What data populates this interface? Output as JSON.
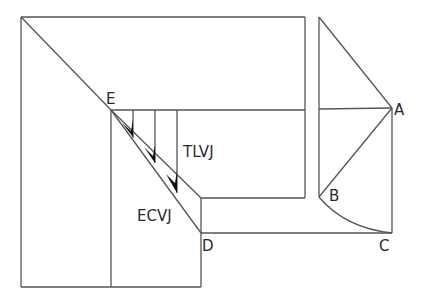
{
  "diagram": {
    "labels": {
      "A": "A",
      "B": "B",
      "C": "C",
      "D": "D",
      "E": "E",
      "tlvj": "TLVJ",
      "ecvj": "ECVJ"
    },
    "colors": {
      "line": "#555555",
      "arrow": "#111111",
      "text": "#2a2a2a",
      "background": "#ffffff"
    },
    "points": {
      "A": [
        392,
        108
      ],
      "B": [
        319,
        197
      ],
      "C": [
        392,
        233
      ],
      "D": [
        201,
        233
      ],
      "E": [
        111,
        110
      ]
    }
  }
}
